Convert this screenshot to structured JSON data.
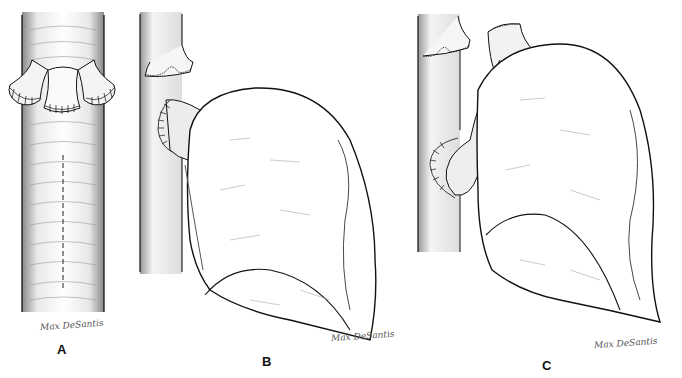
{
  "figure": {
    "panels": [
      {
        "id": "A",
        "label": "A",
        "signature": "Max DeSantis",
        "content": "vertical tube with three sutured stumps and dashed incision line"
      },
      {
        "id": "B",
        "label": "B",
        "signature": "Max DeSantis",
        "content": "tube with sutured stump, side anastomosis to large bulbous organ"
      },
      {
        "id": "C",
        "label": "C",
        "signature": "Max DeSantis",
        "content": "tube with sutured stump, side anastomosis and separate sutured conduit to large bulbous organ"
      }
    ]
  },
  "colors": {
    "ink": "#111111",
    "shade": "#777777",
    "background": "#ffffff"
  }
}
